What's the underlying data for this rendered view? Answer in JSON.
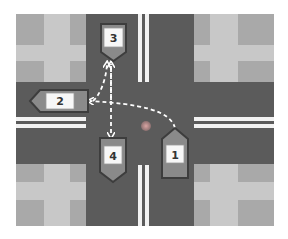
{
  "diagram": {
    "colors": {
      "road": "#5b5b5b",
      "lane_marking": "#f2f2f2",
      "block_light": "#c8c8c8",
      "block_dark": "#a9a9a9",
      "car_body": "#8a8a8a",
      "car_border": "#3d3d3d",
      "label_box": "#f7f7f7",
      "path": "#ffffff",
      "marker_dot": "#c9918f"
    },
    "cars": [
      {
        "id": "car-1",
        "label": "1",
        "heading": "up"
      },
      {
        "id": "car-2",
        "label": "2",
        "heading": "left"
      },
      {
        "id": "car-3",
        "label": "3",
        "heading": "down"
      },
      {
        "id": "car-4",
        "label": "4",
        "heading": "down"
      }
    ],
    "paths": [
      {
        "from": "1",
        "to": "2",
        "style": "dashed-arrow",
        "description": "Car 1 turns left toward west exit"
      },
      {
        "from": "4",
        "to": "3",
        "style": "dashed-double-arrow",
        "description": "Car 3/4 straight through north-south"
      },
      {
        "from": "2",
        "to": "3",
        "style": "dashed-arrow",
        "description": "Curve from west to north"
      }
    ],
    "marker": {
      "name": "intersection-center-dot"
    }
  }
}
